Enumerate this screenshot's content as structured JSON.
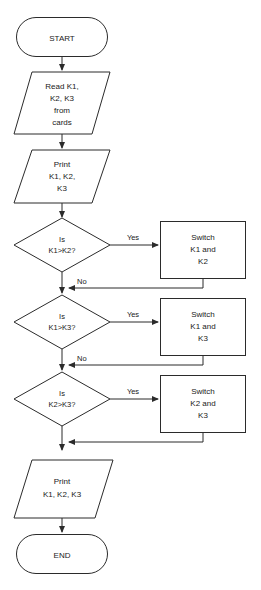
{
  "diagram": {
    "type": "flowchart",
    "background_color": "#ffffff",
    "stroke_color": "#2b2b2b",
    "nodes": {
      "start": {
        "shape": "terminator",
        "text": "START"
      },
      "read": {
        "shape": "parallelogram",
        "lines": [
          "Read  K1,",
          "K2,  K3",
          "from",
          "cards"
        ]
      },
      "print_first": {
        "shape": "parallelogram",
        "lines": [
          "Print",
          "K1,  K2,",
          "K3"
        ]
      },
      "decision1": {
        "shape": "diamond",
        "lines": [
          "Is",
          "K1>K2?"
        ]
      },
      "switch1": {
        "shape": "process",
        "lines": [
          "Switch",
          "K1  and",
          "K2"
        ]
      },
      "decision2": {
        "shape": "diamond",
        "lines": [
          "Is",
          "K1>K3?"
        ]
      },
      "switch2": {
        "shape": "process",
        "lines": [
          "Switch",
          "K1  and",
          "K3"
        ]
      },
      "decision3": {
        "shape": "diamond",
        "lines": [
          "Is",
          "K2>K3?"
        ]
      },
      "switch3": {
        "shape": "process",
        "lines": [
          "Switch",
          "K2  and",
          "K3"
        ]
      },
      "print_last": {
        "shape": "parallelogram",
        "lines": [
          "Print",
          "K1,  K2,  K3"
        ]
      },
      "end": {
        "shape": "terminator",
        "text": "END"
      }
    },
    "edge_labels": {
      "yes1": "Yes",
      "no1": "No",
      "yes2": "Yes",
      "no2": "No",
      "yes3": "Yes"
    }
  }
}
